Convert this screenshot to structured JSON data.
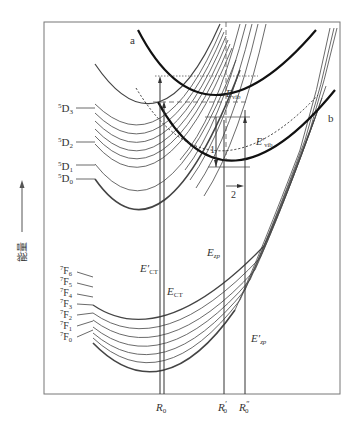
{
  "figure": {
    "type": "configurational-coordinate-diagram",
    "y_axis_label": "能量",
    "y_axis_arrow": "up-arrow",
    "x_ticks": [
      {
        "label_main": "R",
        "label_sub": "0",
        "prime": ""
      },
      {
        "label_main": "R",
        "label_sub": "0",
        "prime": "′"
      },
      {
        "label_main": "R",
        "label_sub": "0",
        "prime": "″"
      }
    ],
    "curve_labels": {
      "a": "a",
      "b": "b"
    },
    "excited_levels": [
      {
        "sup": "5",
        "main": "D",
        "sub": "3"
      },
      {
        "sup": "5",
        "main": "D",
        "sub": "2"
      },
      {
        "sup": "5",
        "main": "D",
        "sub": "1"
      },
      {
        "sup": "5",
        "main": "D",
        "sub": "0"
      }
    ],
    "ground_levels": [
      {
        "sup": "7",
        "main": "F",
        "sub": "6"
      },
      {
        "sup": "7",
        "main": "F",
        "sub": "5"
      },
      {
        "sup": "7",
        "main": "F",
        "sub": "4"
      },
      {
        "sup": "7",
        "main": "F",
        "sub": "3"
      },
      {
        "sup": "7",
        "main": "F",
        "sub": "2"
      },
      {
        "sup": "7",
        "main": "F",
        "sub": "1"
      },
      {
        "sup": "7",
        "main": "F",
        "sub": "0"
      }
    ],
    "energy_labels": {
      "e_ct_prime": {
        "main": "E′",
        "sub": "CT"
      },
      "e_ct": {
        "main": "E",
        "sub": "CT"
      },
      "e_zp": {
        "main": "E",
        "sub": "zp"
      },
      "e_zp_prime": {
        "main": "E′",
        "sub": "zp"
      },
      "e_vib": {
        "main": "E",
        "sub": "vib"
      },
      "e_vib_prime": {
        "main": "E′",
        "sub": "vib"
      }
    },
    "transition_markers": [
      "1",
      "2"
    ]
  }
}
